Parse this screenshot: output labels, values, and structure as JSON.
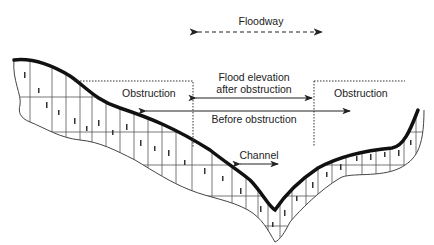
{
  "diagram": {
    "labels": {
      "floodway": "Floodway",
      "obstruction_left": "Obstruction",
      "obstruction_right": "Obstruction",
      "flood_elevation_line1": "Flood elevation",
      "flood_elevation_line2": "after obstruction",
      "before_obstruction": "Before obstruction",
      "channel": "Channel"
    },
    "colors": {
      "ground_line": "#111111",
      "hatch": "#333333",
      "text": "#222222",
      "background": "#ffffff"
    }
  }
}
